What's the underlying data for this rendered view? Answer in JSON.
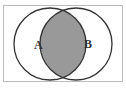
{
  "diagram": {
    "type": "venn",
    "sets": [
      {
        "label": "A",
        "cx": 50,
        "cy": 44,
        "r": 36
      },
      {
        "label": "B",
        "cx": 76,
        "cy": 44,
        "r": 36
      }
    ],
    "shaded_region": "A ∩ B",
    "colors": {
      "background": "#ffffff",
      "frame": "#bbbbbb",
      "outline": "#333333",
      "shade": "#999999"
    }
  }
}
